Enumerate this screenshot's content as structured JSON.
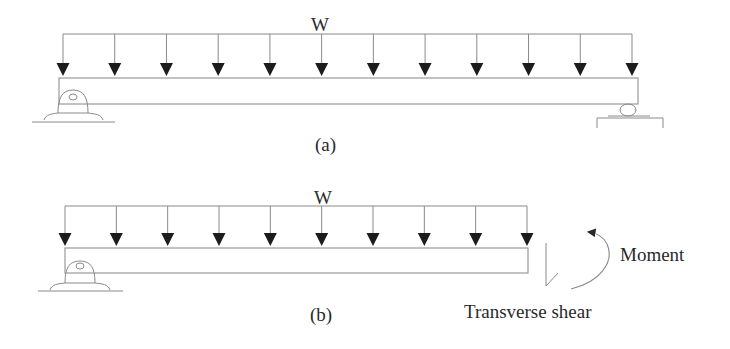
{
  "figure": {
    "colors": {
      "line": "#8a8a8a",
      "arrowhead": "#1c1c1c",
      "text": "#2a2a2a",
      "background": "#ffffff"
    }
  },
  "diagram_a": {
    "load_label": "W",
    "caption": "(a)",
    "load_arrow_count": 12,
    "supports": [
      "pin-left",
      "roller-right"
    ]
  },
  "diagram_b": {
    "load_label": "W",
    "caption": "(b)",
    "load_arrow_count": 10,
    "supports": [
      "pin-left"
    ],
    "moment_label": "Moment",
    "shear_label": "Transverse shear"
  }
}
